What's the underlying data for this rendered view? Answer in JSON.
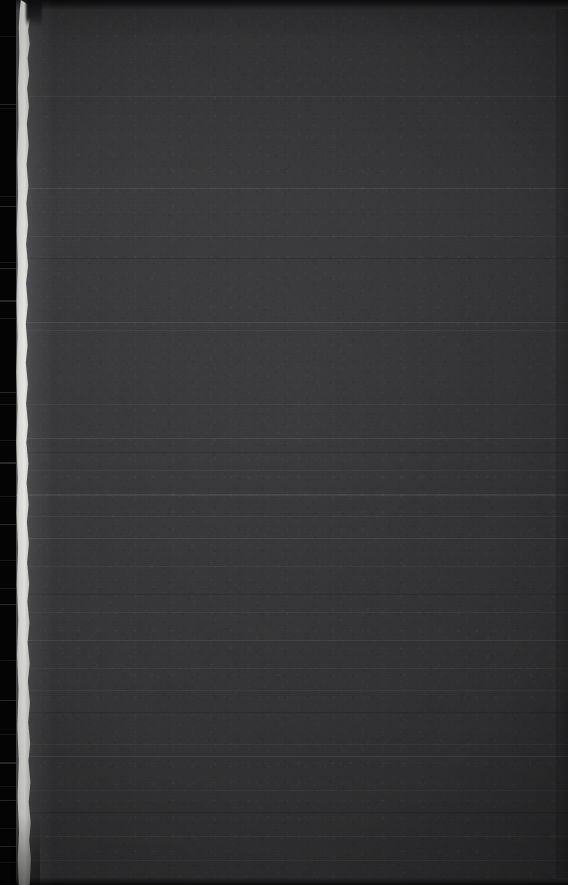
{
  "image": {
    "description": "Very dark, underexposed photograph. A flat dark charcoal field fills most of the frame. A bright, irregular cream-white vertical band runs top-to-bottom near the left edge, bordered on its far left by a narrow black strip. Horizontal scan banding and sensor noise are visible across the field.",
    "width": 568,
    "height": 885,
    "orientation": "portrait",
    "exposure": "underexposed",
    "visible_text": "none"
  },
  "regions": {
    "left_black_strip": {
      "name": "left-black-strip",
      "x_start": 0,
      "x_end": 16,
      "color": "#050506"
    },
    "light_band": {
      "name": "bright-vertical-band",
      "x_start": 14,
      "x_end": 32,
      "color": "#fffffd",
      "edge_color": "#ecebe4",
      "shape": "irregular wavy torn edge"
    },
    "dark_field": {
      "name": "dark-field",
      "x_start": 32,
      "x_end": 568,
      "color": "#3a3a3c",
      "color_left": "#3f3f41",
      "color_right": "#343436"
    },
    "top_band": {
      "name": "top-dark-band",
      "height": 9,
      "color": "#0d0d0e"
    },
    "bottom_band": {
      "name": "bottom-dark-band",
      "height": 7,
      "color": "#0b0b0c"
    },
    "right_edge_line": {
      "name": "right-edge-line",
      "x": 556,
      "color": "#2d2d2f"
    }
  },
  "artifacts": {
    "horizontal_banding": true,
    "sensor_noise": true,
    "vignette": true,
    "streak_rows": [
      96,
      188,
      236,
      258,
      322,
      330,
      404,
      438,
      452,
      470,
      494,
      516,
      538,
      566,
      594,
      612,
      640,
      668,
      690,
      712,
      744,
      756,
      790,
      812,
      836,
      860
    ],
    "strip_tick_rows": [
      36,
      104,
      108,
      196,
      206,
      262,
      268,
      300,
      318,
      392,
      404,
      440,
      462,
      496,
      524,
      560,
      588,
      604,
      660,
      700,
      734,
      762,
      786,
      800,
      828,
      846,
      862
    ]
  },
  "palette": {
    "black": "#050506",
    "white": "#fffffd",
    "cream": "#ecebe4",
    "charcoal": "#3a3a3c",
    "charcoal_light": "#3f3f41",
    "charcoal_dark": "#343436",
    "near_black": "#0d0d0e"
  }
}
